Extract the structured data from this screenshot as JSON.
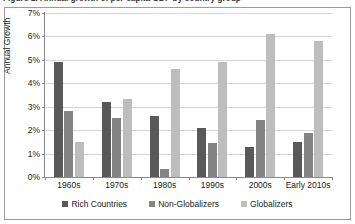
{
  "figure": {
    "caption": "Figure 1: Annual growth of per-capita GDP by country group"
  },
  "chart_data": {
    "type": "bar",
    "title": "",
    "xlabel": "",
    "ylabel": "Annual Growth",
    "ylim": [
      0,
      7
    ],
    "ytick_step": 1,
    "ytick_labels": [
      "0%",
      "1%",
      "2%",
      "3%",
      "4%",
      "5%",
      "6%",
      "7%"
    ],
    "ytick_values": [
      0,
      1,
      2,
      3,
      4,
      5,
      6,
      7
    ],
    "grid": true,
    "legend_position": "bottom-center",
    "categories": [
      "1960s",
      "1970s",
      "1980s",
      "1990s",
      "2000s",
      "Early 2010s"
    ],
    "series": [
      {
        "name": "Rich Countries",
        "color": "#595959",
        "values": [
          4.9,
          3.2,
          2.6,
          2.1,
          1.3,
          1.5
        ]
      },
      {
        "name": "Non-Globalizers",
        "color": "#848484",
        "values": [
          2.8,
          2.5,
          0.35,
          1.45,
          2.45,
          1.9
        ]
      },
      {
        "name": "Globalizers",
        "color": "#bdbdbd",
        "values": [
          1.5,
          3.35,
          4.6,
          4.9,
          6.1,
          5.8
        ]
      }
    ]
  }
}
